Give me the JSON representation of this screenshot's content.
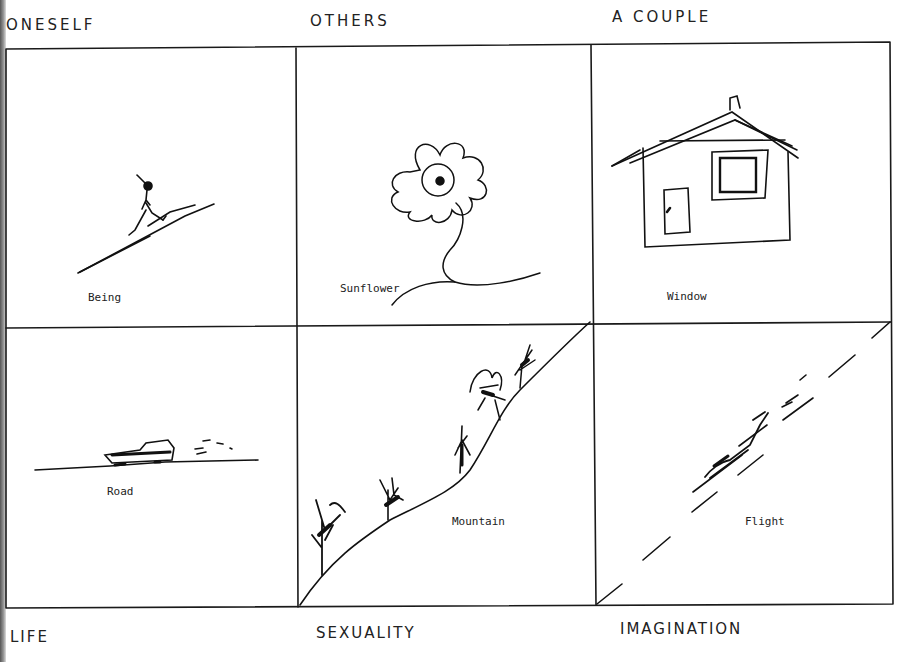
{
  "headers": {
    "top_left": "ONESELF",
    "top_center": "OTHERS",
    "top_right": "A COUPLE",
    "bottom_left": "LIFE",
    "bottom_center": "SEXUALITY",
    "bottom_right": "IMAGINATION"
  },
  "cells": [
    {
      "row": 1,
      "col": 1,
      "caption": "Being",
      "drawing": "stick-figure-walking-up-slope"
    },
    {
      "row": 1,
      "col": 2,
      "caption": "Sunflower",
      "drawing": "flower-with-stem"
    },
    {
      "row": 1,
      "col": 3,
      "caption": "Window",
      "drawing": "house-with-window-and-door"
    },
    {
      "row": 2,
      "col": 1,
      "caption": "Road",
      "drawing": "car-on-road"
    },
    {
      "row": 2,
      "col": 2,
      "caption": "Mountain",
      "drawing": "hill-slope-with-trees"
    },
    {
      "row": 2,
      "col": 3,
      "caption": "Flight",
      "drawing": "airplane-on-dashed-diagonal"
    }
  ]
}
